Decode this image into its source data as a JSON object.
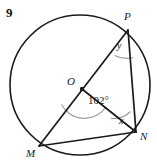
{
  "figure": {
    "problem_number": "9",
    "type": "circle-geometry-diagram",
    "background_color": "#ffffff",
    "stroke_color": "#1a1a1a",
    "arc_marker_color": "#8a8a8a",
    "labels": {
      "point_p": "P",
      "point_n": "N",
      "point_m": "M",
      "center_o": "O",
      "angle_at_p": "y",
      "angle_at_n": "x",
      "central_angle": "102°"
    },
    "geometry": {
      "circle": {
        "cx": 80,
        "cy": 85,
        "r": 70
      },
      "points": {
        "O": {
          "x": 82,
          "y": 89
        },
        "P": {
          "x": 128,
          "y": 30
        },
        "N": {
          "x": 136,
          "y": 132
        },
        "M": {
          "x": 39,
          "y": 146
        }
      },
      "segments": [
        {
          "name": "MP-diameter",
          "from": "M",
          "to": "P"
        },
        {
          "name": "ON-radius",
          "from": "O",
          "to": "N"
        },
        {
          "name": "PN-chord",
          "from": "P",
          "to": "N"
        },
        {
          "name": "MN-chord",
          "from": "M",
          "to": "N"
        }
      ]
    }
  }
}
